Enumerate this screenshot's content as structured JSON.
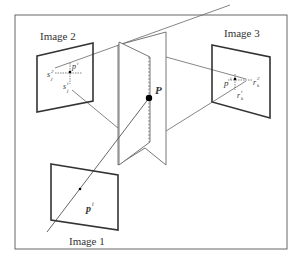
{
  "diagram": {
    "type": "multi-view geometry / point correspondence",
    "colors": {
      "line": "#555555",
      "frame": "#666666",
      "thick": "#333333",
      "point": "#000000"
    },
    "images": [
      {
        "label": "Image 1",
        "point_label": "p",
        "point_sup": "i"
      },
      {
        "label": "Image 2",
        "point_label": "p",
        "point_sup": "i",
        "extra_labels": [
          {
            "base": "s",
            "sup": "2",
            "sub": "j"
          },
          {
            "base": "s",
            "sup": "i",
            "sub": "j"
          }
        ]
      },
      {
        "label": "Image 3",
        "point_label": "p",
        "point_sup": "i",
        "extra_labels": [
          {
            "base": "r",
            "sup": "2",
            "sub": "k"
          },
          {
            "base": "r",
            "sup": "i",
            "sub": "k"
          }
        ]
      }
    ],
    "world_point": {
      "label": "P"
    }
  }
}
